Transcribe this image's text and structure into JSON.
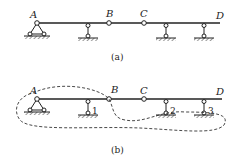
{
  "figure_a": {
    "caption": "(a)",
    "points": {
      "A": "A",
      "B": "B",
      "C": "C",
      "D": "D"
    }
  },
  "figure_b": {
    "caption": "(b)",
    "points": {
      "A": "A",
      "B": "B",
      "C": "C",
      "D": "D"
    },
    "supports": {
      "s1": "1",
      "s2": "2",
      "s3": "3"
    }
  }
}
